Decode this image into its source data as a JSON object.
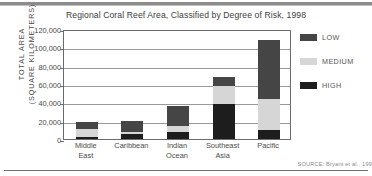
{
  "chart_data": {
    "type": "bar",
    "subtype": "stacked-vertical",
    "title": "Regional Coral Reef Area, Classified by Degree of Risk, 1998",
    "xlabel": "",
    "ylabel": "TOTAL AREA (SQUARE KILOMETERS)",
    "ylabel_line1": "TOTAL AREA",
    "ylabel_line2": "(SQUARE KILOMETERS)",
    "categories": [
      "Middle East",
      "Caribbean",
      "Indian Ocean",
      "Southeast Asia",
      "Pacific"
    ],
    "category_lines": [
      [
        "Middle",
        "East"
      ],
      [
        "Caribbean"
      ],
      [
        "Indian",
        "Ocean"
      ],
      [
        "Southeast",
        "Asia"
      ],
      [
        "Pacific"
      ]
    ],
    "series": [
      {
        "name": "HIGH",
        "color": "#1d1d1d",
        "values": [
          2000,
          6000,
          8000,
          38000,
          10000
        ]
      },
      {
        "name": "MEDIUM",
        "color": "#d6d6d6",
        "values": [
          9000,
          2000,
          6000,
          20000,
          34000
        ]
      },
      {
        "name": "LOW",
        "color": "#454545",
        "values": [
          8000,
          12000,
          22000,
          10000,
          64000
        ]
      }
    ],
    "stack_order": [
      "HIGH",
      "MEDIUM",
      "LOW"
    ],
    "totals": [
      19000,
      20000,
      36000,
      68000,
      108000
    ],
    "ylim": [
      0,
      120000
    ],
    "ytick_step": 20000,
    "yticks": [
      "0",
      "20,000",
      "40,000",
      "60,000",
      "80,000",
      "100,000",
      "120,000"
    ],
    "ytick_values": [
      0,
      20000,
      40000,
      60000,
      80000,
      100000,
      120000
    ],
    "grid": true,
    "grid_axis": "y",
    "legend_position": "right",
    "legend": [
      {
        "label": "LOW",
        "color": "#454545"
      },
      {
        "label": "MEDIUM",
        "color": "#d6d6d6"
      },
      {
        "label": "HIGH",
        "color": "#1d1d1d"
      }
    ]
  },
  "source": {
    "text": "SOURCE: Bryant et al., 199"
  },
  "colors": {
    "low": "#454545",
    "medium": "#d6d6d6",
    "high": "#1d1d1d",
    "axis": "#6b6b6b",
    "grid": "#9a9a9a",
    "text": "#4a4a4a",
    "rule": "#8c8c8c"
  }
}
